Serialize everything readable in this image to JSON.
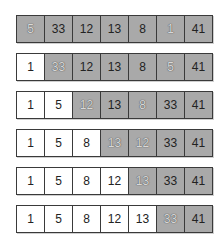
{
  "diagram": {
    "title": "",
    "colors": {
      "shaded": "#a9a9a9",
      "unshaded": "#ffffff",
      "border": "#3a3a3a"
    },
    "rows": [
      {
        "cells": [
          {
            "v": "5",
            "shaded": true,
            "hl": true
          },
          {
            "v": "33",
            "shaded": true,
            "hl": false
          },
          {
            "v": "12",
            "shaded": true,
            "hl": false
          },
          {
            "v": "13",
            "shaded": true,
            "hl": false
          },
          {
            "v": "8",
            "shaded": true,
            "hl": false
          },
          {
            "v": "1",
            "shaded": true,
            "hl": true
          },
          {
            "v": "41",
            "shaded": true,
            "hl": false
          }
        ]
      },
      {
        "cells": [
          {
            "v": "1",
            "shaded": false,
            "hl": false
          },
          {
            "v": "33",
            "shaded": true,
            "hl": true
          },
          {
            "v": "12",
            "shaded": true,
            "hl": false
          },
          {
            "v": "13",
            "shaded": true,
            "hl": false
          },
          {
            "v": "8",
            "shaded": true,
            "hl": false
          },
          {
            "v": "5",
            "shaded": true,
            "hl": true
          },
          {
            "v": "41",
            "shaded": true,
            "hl": false
          }
        ]
      },
      {
        "cells": [
          {
            "v": "1",
            "shaded": false,
            "hl": false
          },
          {
            "v": "5",
            "shaded": false,
            "hl": false
          },
          {
            "v": "12",
            "shaded": true,
            "hl": true
          },
          {
            "v": "13",
            "shaded": true,
            "hl": false
          },
          {
            "v": "8",
            "shaded": true,
            "hl": true
          },
          {
            "v": "33",
            "shaded": true,
            "hl": false
          },
          {
            "v": "41",
            "shaded": true,
            "hl": false
          }
        ]
      },
      {
        "cells": [
          {
            "v": "1",
            "shaded": false,
            "hl": false
          },
          {
            "v": "5",
            "shaded": false,
            "hl": false
          },
          {
            "v": "8",
            "shaded": false,
            "hl": false
          },
          {
            "v": "13",
            "shaded": true,
            "hl": true
          },
          {
            "v": "12",
            "shaded": true,
            "hl": true
          },
          {
            "v": "33",
            "shaded": true,
            "hl": false
          },
          {
            "v": "41",
            "shaded": true,
            "hl": false
          }
        ]
      },
      {
        "cells": [
          {
            "v": "1",
            "shaded": false,
            "hl": false
          },
          {
            "v": "5",
            "shaded": false,
            "hl": false
          },
          {
            "v": "8",
            "shaded": false,
            "hl": false
          },
          {
            "v": "12",
            "shaded": false,
            "hl": false
          },
          {
            "v": "13",
            "shaded": true,
            "hl": true
          },
          {
            "v": "33",
            "shaded": true,
            "hl": false
          },
          {
            "v": "41",
            "shaded": true,
            "hl": false
          }
        ]
      },
      {
        "cells": [
          {
            "v": "1",
            "shaded": false,
            "hl": false
          },
          {
            "v": "5",
            "shaded": false,
            "hl": false
          },
          {
            "v": "8",
            "shaded": false,
            "hl": false
          },
          {
            "v": "12",
            "shaded": false,
            "hl": false
          },
          {
            "v": "13",
            "shaded": false,
            "hl": false
          },
          {
            "v": "33",
            "shaded": true,
            "hl": true
          },
          {
            "v": "41",
            "shaded": true,
            "hl": false
          }
        ]
      }
    ]
  }
}
